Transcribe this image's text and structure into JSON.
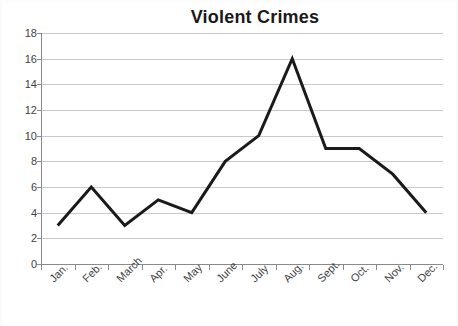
{
  "chart_data": {
    "type": "line",
    "title": "Violent Crimes",
    "xlabel": "",
    "ylabel": "",
    "categories": [
      "Jan.",
      "Feb.",
      "March",
      "Apr.",
      "May",
      "June",
      "July",
      "Aug.",
      "Sept.",
      "Oct.",
      "Nov.",
      "Dec."
    ],
    "values": [
      3,
      6,
      3,
      5,
      4,
      8,
      10,
      16,
      9,
      9,
      7,
      4
    ],
    "series": [
      {
        "name": "Violent Crimes",
        "values": [
          3,
          6,
          3,
          5,
          4,
          8,
          10,
          16,
          9,
          9,
          7,
          4
        ],
        "color": "#1a1a1a"
      }
    ],
    "ylim": [
      0,
      18
    ],
    "yticks": [
      0,
      2,
      4,
      6,
      8,
      10,
      12,
      14,
      16,
      18
    ],
    "ytick_labels": [
      "0",
      "2",
      "4",
      "6",
      "8",
      "10",
      "12",
      "14",
      "16",
      "18"
    ],
    "grid": true,
    "grid_axis": "y",
    "legend": false,
    "legend_position": "none",
    "line_color": "#1a1a1a",
    "line_width": 3,
    "markers": false,
    "gridline_color": "#c9c9c9",
    "axis_color": "#8a8a8a",
    "background_color": "#ffffff",
    "tick_label_rotation": -45
  }
}
